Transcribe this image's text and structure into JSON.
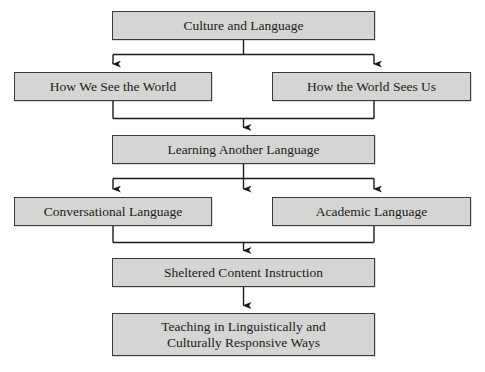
{
  "diagram": {
    "type": "flowchart",
    "style": {
      "box_fill": "#d5d5d3",
      "box_border": "#3a3a3a",
      "connector_color": "#1a1a1a",
      "text_color": "#1a1a1a",
      "background": "#ffffff"
    },
    "nodes": [
      {
        "id": "culture",
        "label": "Culture and Language"
      },
      {
        "id": "how_we_see",
        "label": "How We See the World"
      },
      {
        "id": "how_world_sees",
        "label": "How the World Sees Us"
      },
      {
        "id": "learning",
        "label": "Learning Another Language"
      },
      {
        "id": "conversational",
        "label": "Conversational Language"
      },
      {
        "id": "academic",
        "label": "Academic Language"
      },
      {
        "id": "sheltered",
        "label": "Sheltered Content Instruction"
      },
      {
        "id": "teaching",
        "label": "Teaching in Linguistically and\nCulturally Responsive Ways"
      }
    ],
    "edges": [
      {
        "from": "culture",
        "to": "how_we_see",
        "kind": "split-left"
      },
      {
        "from": "culture",
        "to": "how_world_sees",
        "kind": "split-right"
      },
      {
        "from": "how_we_see",
        "to": "learning",
        "kind": "merge-left"
      },
      {
        "from": "how_world_sees",
        "to": "learning",
        "kind": "merge-right"
      },
      {
        "from": "learning",
        "to": "conversational",
        "kind": "split-left"
      },
      {
        "from": "learning",
        "to": "academic",
        "kind": "split-right"
      },
      {
        "from": "learning",
        "to": "",
        "kind": "split-center-stub"
      },
      {
        "from": "conversational",
        "to": "sheltered",
        "kind": "merge-left"
      },
      {
        "from": "academic",
        "to": "sheltered",
        "kind": "merge-right"
      },
      {
        "from": "sheltered",
        "to": "teaching",
        "kind": "direct"
      }
    ]
  }
}
